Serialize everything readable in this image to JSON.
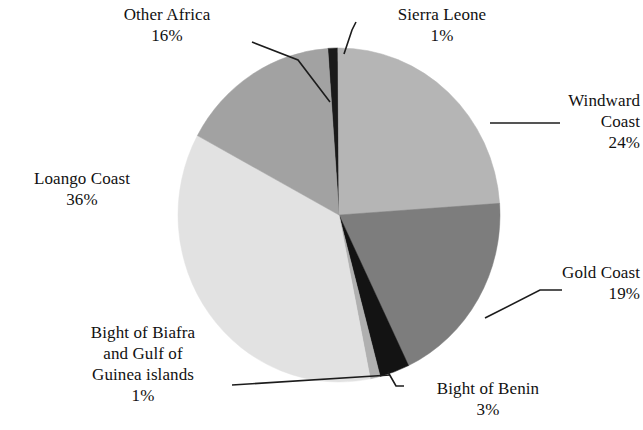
{
  "chart_data": {
    "type": "pie",
    "title": "",
    "subtitle": "",
    "xlabel": "",
    "ylabel": "",
    "legend_position": "none",
    "grid": false,
    "units": "percent",
    "total": 100,
    "start_angle_deg": -4,
    "direction": "clockwise",
    "categories": [
      "Sierra Leone",
      "Windward Coast",
      "Gold Coast",
      "Bight of Benin",
      "Bight of Biafra and Gulf of Guinea islands",
      "Loango Coast",
      "Other Africa"
    ],
    "values": [
      1,
      24,
      19,
      3,
      1,
      36,
      16
    ],
    "colors": [
      "#1a1a1a",
      "#b5b5b5",
      "#7d7d7d",
      "#131313",
      "#b0b0b0",
      "#e2e2e2",
      "#a2a2a2"
    ],
    "slices": [
      {
        "name": "Sierra Leone",
        "value": 1,
        "value_label": "1%",
        "color": "#1a1a1a"
      },
      {
        "name": "Windward Coast",
        "value": 24,
        "value_label": "24%",
        "color": "#b5b5b5"
      },
      {
        "name": "Gold Coast",
        "value": 19,
        "value_label": "19%",
        "color": "#7d7d7d"
      },
      {
        "name": "Bight of Benin",
        "value": 3,
        "value_label": "3%",
        "color": "#131313"
      },
      {
        "name": "Bight of Biafra and Gulf of Guinea islands",
        "value": 1,
        "value_label": "1%",
        "color": "#b0b0b0"
      },
      {
        "name": "Loango Coast",
        "value": 36,
        "value_label": "36%",
        "color": "#e2e2e2"
      },
      {
        "name": "Other Africa",
        "value": 16,
        "value_label": "16%",
        "color": "#a2a2a2"
      }
    ]
  },
  "labels": {
    "other_africa": {
      "name": "Other Africa",
      "pct": "16%"
    },
    "sierra_leone": {
      "name": "Sierra Leone",
      "pct": "1%"
    },
    "windward_coast": {
      "line1": "Windward",
      "line2": "Coast",
      "pct": "24%"
    },
    "gold_coast": {
      "name": "Gold Coast",
      "pct": "19%"
    },
    "loango_coast": {
      "name": "Loango Coast",
      "pct": "36%"
    },
    "biafra": {
      "line1": "Bight of Biafra",
      "line2": "and Gulf of",
      "line3": "Guinea islands",
      "pct": "1%"
    },
    "bight_benin": {
      "name": "Bight of Benin",
      "pct": "3%"
    }
  },
  "style": {
    "background": "#ffffff",
    "text_color": "#111111",
    "leader_color": "#1c1c1c"
  }
}
